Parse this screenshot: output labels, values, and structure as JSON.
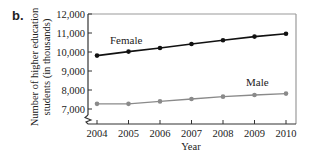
{
  "panel_label": "b.",
  "chart_data": {
    "type": "line",
    "title": "",
    "xlabel": "Year",
    "ylabel": "Number of higher education students (in thousands)",
    "ylabel_lines": [
      "Number of higher education",
      "students (in thousands)"
    ],
    "x": [
      2004,
      2005,
      2006,
      2007,
      2008,
      2009,
      2010
    ],
    "x_tick_labels": [
      "2004",
      "2005",
      "2006",
      "2007",
      "2008",
      "2009",
      "2010"
    ],
    "y_ticks": [
      7000,
      8000,
      9000,
      10000,
      11000,
      12000
    ],
    "y_tick_labels": [
      "7,000",
      "8,000",
      "9,000",
      "10,000",
      "11,000",
      "12,000"
    ],
    "ylim": [
      6200,
      12000
    ],
    "y_axis_break": true,
    "grid": false,
    "legend": "inline labels",
    "series": [
      {
        "name": "Female",
        "color": "#111111",
        "values": [
          9810,
          10020,
          10210,
          10420,
          10620,
          10810,
          10960
        ]
      },
      {
        "name": "Male",
        "color": "#8a8a8a",
        "values": [
          7270,
          7270,
          7400,
          7530,
          7650,
          7740,
          7810
        ]
      }
    ]
  },
  "colors": {
    "frame": "#9a9a9a",
    "text": "#222222"
  }
}
